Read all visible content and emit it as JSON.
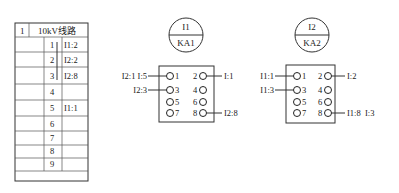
{
  "table": {
    "header": {
      "id": "1",
      "title": "10kV线路"
    },
    "rows": [
      {
        "num": "1",
        "label": "I1:2"
      },
      {
        "num": "2",
        "label": "I2:2"
      },
      {
        "num": "3",
        "label": "I2:8"
      },
      {
        "num": "4",
        "label": ""
      },
      {
        "num": "5",
        "label": "I1:1"
      },
      {
        "num": "6",
        "label": ""
      },
      {
        "num": "7",
        "label": ""
      },
      {
        "num": "8",
        "label": ""
      },
      {
        "num": "9",
        "label": ""
      }
    ]
  },
  "relays": [
    {
      "circle_top": "I1",
      "circle_bottom": "KA1",
      "pins": [
        "1",
        "2",
        "3",
        "4",
        "5",
        "6",
        "7",
        "8"
      ],
      "connections": {
        "pin1": "I2:1  I:5",
        "pin2": "I:1",
        "pin3": "I2:3",
        "pin8": "I2:8"
      }
    },
    {
      "circle_top": "I2",
      "circle_bottom": "KA2",
      "pins": [
        "1",
        "2",
        "3",
        "4",
        "5",
        "6",
        "7",
        "8"
      ],
      "connections": {
        "pin1": "I1:1",
        "pin2": "I:2",
        "pin3": "I1:3",
        "pin8": "I1:8  I:3"
      }
    }
  ]
}
